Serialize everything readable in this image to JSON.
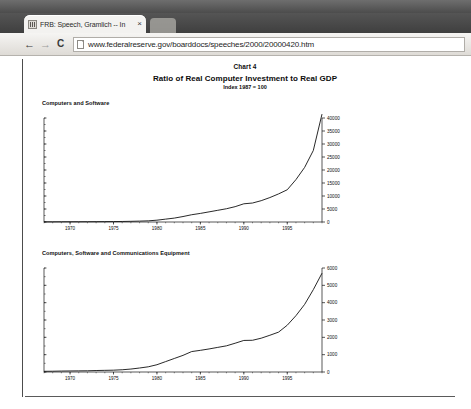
{
  "browser": {
    "tab": {
      "title": "FRB: Speech, Gramlich -- In",
      "favicon_name": "frb-favicon",
      "close_label": "×"
    },
    "new_tab_label": "",
    "nav": {
      "back_label": "←",
      "forward_label": "→",
      "reload_label": "C"
    },
    "omnibox": {
      "url": "www.federalreserve.gov/boarddocs/speeches/2000/20000420.htm",
      "placeholder": "Search or type URL"
    }
  },
  "page": {
    "chart_number": "Chart 4",
    "title": "Ratio of Real Computer Investment to Real GDP",
    "subtitle": "Index 1987 = 100"
  },
  "chart_data": [
    {
      "type": "line",
      "title": "Computers and Software",
      "xlabel": "",
      "ylabel": "",
      "ylim": [
        0,
        40000
      ],
      "xlim": [
        1967,
        1999
      ],
      "grid": false,
      "legend": "none",
      "y_axis_position": "right",
      "yticks": [
        0,
        5000,
        10000,
        15000,
        20000,
        25000,
        30000,
        35000,
        40000
      ],
      "ytick_labels": [
        "0",
        "5000",
        "10000",
        "15000",
        "20000",
        "25000",
        "30000",
        "35000",
        "40000"
      ],
      "xticks": [
        1970,
        1975,
        1980,
        1985,
        1990,
        1995
      ],
      "xtick_labels": [
        "1970",
        "1975",
        "1980",
        "1985",
        "1990",
        "1995"
      ],
      "series": [
        {
          "name": "Computers and Software",
          "x": [
            1967,
            1968,
            1969,
            1970,
            1971,
            1972,
            1973,
            1974,
            1975,
            1976,
            1977,
            1978,
            1979,
            1980,
            1981,
            1982,
            1983,
            1984,
            1985,
            1986,
            1987,
            1988,
            1989,
            1990,
            1991,
            1992,
            1993,
            1994,
            1995,
            1996,
            1997,
            1998,
            1999
          ],
          "values": [
            60,
            70,
            85,
            95,
            100,
            110,
            130,
            150,
            170,
            200,
            260,
            340,
            450,
            700,
            1100,
            1500,
            2100,
            2800,
            3300,
            3900,
            4500,
            5100,
            5900,
            7000,
            7300,
            8200,
            9400,
            10800,
            12400,
            16300,
            21000,
            27500,
            41500
          ]
        }
      ]
    },
    {
      "type": "line",
      "title": "Computers, Software and Communications Equipment",
      "xlabel": "",
      "ylabel": "",
      "ylim": [
        0,
        6000
      ],
      "xlim": [
        1967,
        1999
      ],
      "grid": false,
      "legend": "none",
      "y_axis_position": "right",
      "yticks": [
        0,
        1000,
        2000,
        3000,
        4000,
        5000,
        6000
      ],
      "ytick_labels": [
        "0",
        "1000",
        "2000",
        "3000",
        "4000",
        "5000",
        "6000"
      ],
      "xticks": [
        1970,
        1975,
        1980,
        1985,
        1990,
        1995
      ],
      "xtick_labels": [
        "1970",
        "1975",
        "1980",
        "1985",
        "1990",
        "1995"
      ],
      "series": [
        {
          "name": "Computers, Software and Communications Equipment",
          "x": [
            1967,
            1968,
            1969,
            1970,
            1971,
            1972,
            1973,
            1974,
            1975,
            1976,
            1977,
            1978,
            1979,
            1980,
            1981,
            1982,
            1983,
            1984,
            1985,
            1986,
            1987,
            1988,
            1989,
            1990,
            1991,
            1992,
            1993,
            1994,
            1995,
            1996,
            1997,
            1998,
            1999
          ],
          "values": [
            40,
            45,
            55,
            60,
            65,
            70,
            85,
            95,
            105,
            130,
            170,
            230,
            300,
            420,
            600,
            780,
            960,
            1180,
            1250,
            1330,
            1420,
            1510,
            1660,
            1820,
            1830,
            1950,
            2120,
            2300,
            2700,
            3250,
            3900,
            4750,
            5700
          ]
        }
      ]
    }
  ],
  "colors": {
    "line": "#111111",
    "axis": "#111111",
    "page_bg": "#ffffff",
    "chrome_dark": "#4c4c4c",
    "toolbar": "#dedbd6"
  }
}
